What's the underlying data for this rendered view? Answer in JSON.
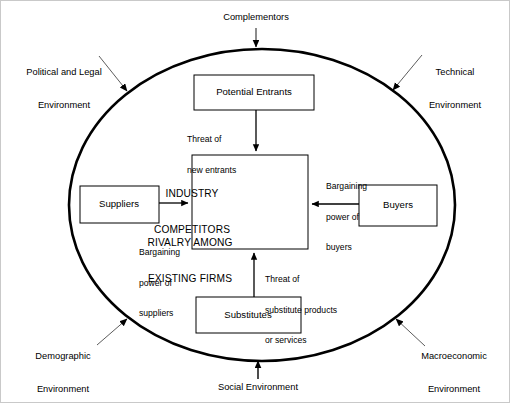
{
  "diagram": {
    "type": "porter-five-forces-with-environment",
    "title_shown": false,
    "shapes": {
      "outer_boundary": "ellipse",
      "boxes": [
        "Potential Entrants",
        "Suppliers",
        "Buyers",
        "Substitutes",
        "Industry Competitors"
      ]
    },
    "colors": {
      "stroke": "#000000",
      "fill": "#ffffff",
      "frame": "#c9c9c9",
      "thin_arrow": "#4a4a4a"
    }
  },
  "environment_labels": [
    {
      "id": "complementors",
      "text": "Complementors",
      "position": "top"
    },
    {
      "id": "political-legal",
      "line1": "Political and Legal",
      "line2": "Environment",
      "position": "top-left"
    },
    {
      "id": "technical",
      "line1": "Technical",
      "line2": "Environment",
      "position": "top-right"
    },
    {
      "id": "demographic",
      "line1": "Demographic",
      "line2": "Environment",
      "position": "bottom-left"
    },
    {
      "id": "macroeconomic",
      "line1": "Macroeconomic",
      "line2": "Environment",
      "position": "bottom-right"
    },
    {
      "id": "social",
      "text": "Social Environment",
      "position": "bottom"
    }
  ],
  "boxes": {
    "potential_entrants": {
      "label": "Potential Entrants"
    },
    "suppliers": {
      "label": "Suppliers"
    },
    "buyers": {
      "label": "Buyers"
    },
    "substitutes": {
      "label": "Substitutes"
    },
    "core": {
      "line1": "INDUSTRY",
      "line2": "COMPETITORS",
      "line3": "RIVALRY AMONG",
      "line4": "EXISTING FIRMS"
    }
  },
  "force_labels": {
    "threat_new_entrants": {
      "line1": "Threat of",
      "line2": "new entrants"
    },
    "bargaining_power_buyers": {
      "line1": "Bargaining",
      "line2": "power of",
      "line3": "buyers"
    },
    "bargaining_power_suppliers": {
      "line1": "Bargaining",
      "line2": "power of",
      "line3": "suppliers"
    },
    "threat_substitutes": {
      "line1": "Threat of",
      "line2": "substitute products",
      "line3": "or services"
    }
  }
}
